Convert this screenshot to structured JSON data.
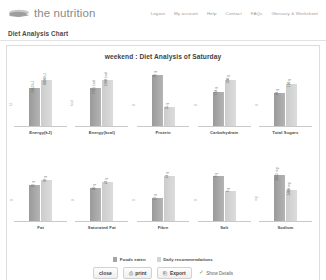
{
  "header": {
    "logo_text": "the nutrition",
    "logo_icon": "leaf-logo-icon",
    "nav": [
      {
        "label": "Logout"
      },
      {
        "label": "My account"
      },
      {
        "label": "Help"
      },
      {
        "label": "Contact"
      },
      {
        "label": "FAQs"
      },
      {
        "label": "Glossary & Worksheet"
      }
    ]
  },
  "page": {
    "title": "Diet Analysis Chart"
  },
  "chart_data": {
    "type": "bar",
    "title": "weekend : Diet Analysis of Saturday",
    "xlabel": "",
    "ylabel": "",
    "grid": false,
    "legend_position": "bottom",
    "categories": [
      "Energy(kJ)",
      "Energy(kcal)",
      "Protein",
      "Carbohydrate",
      "Total Sugars",
      "Fat",
      "Saturated Fat",
      "Fibre",
      "Salt",
      "Sodium"
    ],
    "series": [
      {
        "name": "Foods eaten",
        "color": "#a5a5a5",
        "values": [
          7463,
          1781,
          96,
          44,
          94,
          61,
          20,
          11,
          9,
          3562
        ]
      },
      {
        "name": "Daily recommendations",
        "color": "#d4d4d4",
        "values": [
          8800,
          2100,
          55,
          300,
          120,
          70,
          24,
          24,
          6,
          2400
        ]
      }
    ],
    "panels": [
      {
        "category": "Energy(kJ)",
        "ytick": "kJ",
        "bars": [
          {
            "series": "Foods eaten",
            "label": "7463 kJ",
            "value": 7463,
            "height_pct": 62
          },
          {
            "series": "Daily recommendations",
            "label": "8800 kJ",
            "value": 8800,
            "height_pct": 74
          }
        ]
      },
      {
        "category": "Energy(kcal)",
        "ytick": "kcal",
        "bars": [
          {
            "series": "Foods eaten",
            "label": "1781 kcal",
            "value": 1781,
            "height_pct": 62
          },
          {
            "series": "Daily recommendations",
            "label": "2100 kcal",
            "value": 2100,
            "height_pct": 74
          }
        ]
      },
      {
        "category": "Protein",
        "ytick": "g",
        "bars": [
          {
            "series": "Foods eaten",
            "label": "96 g",
            "value": 96,
            "height_pct": 82
          },
          {
            "series": "Daily recommendations",
            "label": "55 g",
            "value": 55,
            "height_pct": 30
          }
        ]
      },
      {
        "category": "Carbohydrate",
        "ytick": "g",
        "bars": [
          {
            "series": "Foods eaten",
            "label": "194 g",
            "value": 194,
            "height_pct": 55
          },
          {
            "series": "Daily recommendations",
            "label": "300 g",
            "value": 300,
            "height_pct": 74
          }
        ]
      },
      {
        "category": "Total Sugars",
        "ytick": "g",
        "bars": [
          {
            "series": "Foods eaten",
            "label": "94 g",
            "value": 94,
            "height_pct": 54
          },
          {
            "series": "Daily recommendations",
            "label": "120 g",
            "value": 120,
            "height_pct": 68
          }
        ]
      },
      {
        "category": "Fat",
        "ytick": "g",
        "bars": [
          {
            "series": "Foods eaten",
            "label": "61 g",
            "value": 61,
            "height_pct": 58
          },
          {
            "series": "Daily recommendations",
            "label": "70 g",
            "value": 70,
            "height_pct": 66
          }
        ]
      },
      {
        "category": "Saturated Fat",
        "ytick": "g",
        "bars": [
          {
            "series": "Foods eaten",
            "label": "20 g",
            "value": 20,
            "height_pct": 52
          },
          {
            "series": "Daily recommendations",
            "label": "24 g",
            "value": 24,
            "height_pct": 62
          }
        ]
      },
      {
        "category": "Fibre",
        "ytick": "g",
        "bars": [
          {
            "series": "Foods eaten",
            "label": "11 g",
            "value": 11,
            "height_pct": 36
          },
          {
            "series": "Daily recommendations",
            "label": "24 g",
            "value": 24,
            "height_pct": 72
          }
        ]
      },
      {
        "category": "Salt",
        "ytick": "g",
        "bars": [
          {
            "series": "Foods eaten",
            "label": "9 g",
            "value": 9,
            "height_pct": 72
          },
          {
            "series": "Daily recommendations",
            "label": "6 g",
            "value": 6,
            "height_pct": 48
          }
        ]
      },
      {
        "category": "Sodium",
        "ytick": "mg",
        "bars": [
          {
            "series": "Foods eaten",
            "label": "3562 mg",
            "value": 3562,
            "height_pct": 74
          },
          {
            "series": "Daily recommendations",
            "label": "2400 mg",
            "value": 2400,
            "height_pct": 50
          }
        ]
      }
    ]
  },
  "legend": [
    {
      "label": "Foods eaten",
      "color": "#a5a5a5"
    },
    {
      "label": "Daily recommendations",
      "color": "#d4d4d4"
    }
  ],
  "footer": {
    "buttons": [
      {
        "label": "close",
        "icon": ""
      },
      {
        "label": "print",
        "icon": "printer-icon",
        "glyph": "⎙"
      },
      {
        "label": "Export",
        "icon": "export-icon",
        "glyph": "⎗"
      }
    ],
    "show_details": {
      "label": "Show Details",
      "icon": "check-icon",
      "glyph": "✓",
      "checked": true
    }
  }
}
